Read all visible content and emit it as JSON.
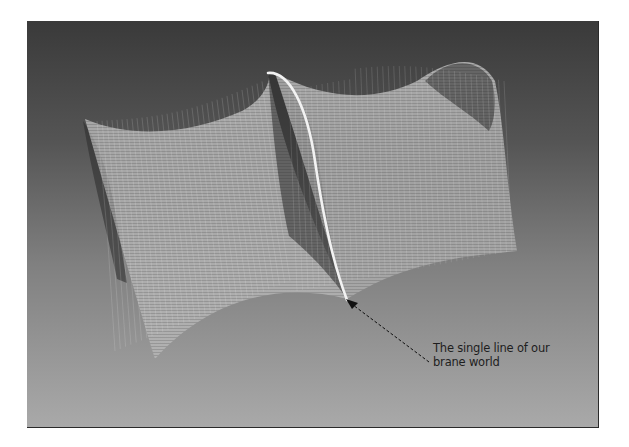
{
  "figure": {
    "annotation": {
      "line1": "The single line of our",
      "line2": "brane world"
    },
    "colors": {
      "background_top": "#3a3a3a",
      "background_bottom": "#a9a9a9",
      "surface_mesh": "#e8e8e8",
      "brane_line": "#f2f2f2",
      "arrow": "#111111",
      "caption_text": "#1e1e1e"
    }
  }
}
